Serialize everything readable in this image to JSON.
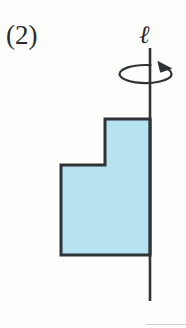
{
  "figure": {
    "number_label": "(2)",
    "axis_label": "ℓ",
    "axis_label_name": "script-ell",
    "rotation_arrow_name": "rotation-arrow",
    "caption_hint": "L-shaped region revolved about vertical axis",
    "colors": {
      "fill": "#b7e3f1",
      "outline": "#2e3338",
      "axis": "#2e3338",
      "background": "#fdfdfb",
      "bottom_rule": "#cfcfcf"
    },
    "axis": {
      "x": 150,
      "y_top": 48,
      "y_bottom": 301
    },
    "rotation_arrow": {
      "center_x": 150,
      "center_y": 74,
      "rx": 26,
      "ry": 9,
      "direction": "clockwise-from-above"
    },
    "shape": {
      "type": "polygon",
      "points": [
        [
          105,
          119
        ],
        [
          150,
          119
        ],
        [
          150,
          255
        ],
        [
          61,
          255
        ],
        [
          61,
          165
        ],
        [
          105,
          165
        ]
      ],
      "stroke_width": 3
    }
  }
}
